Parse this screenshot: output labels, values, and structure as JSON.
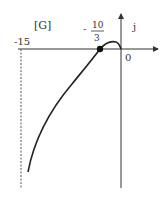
{
  "diagram": {
    "plane_label": "[G]",
    "imag_axis_label": "j",
    "origin_label": "0",
    "left_marker_label": "-15",
    "point_label_sign": "-",
    "point_label_num": "10",
    "point_label_den": "3",
    "colors": {
      "curve": "#222222",
      "axis": "#333333",
      "dashed": "#555555"
    }
  }
}
